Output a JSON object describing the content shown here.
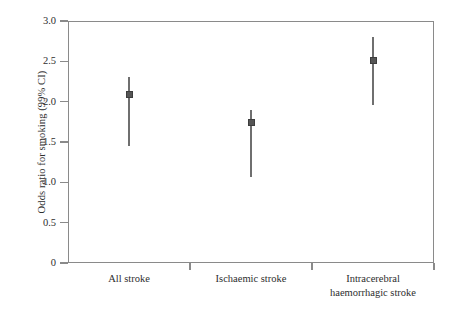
{
  "chart_data": {
    "type": "scatter",
    "title": "",
    "subtitle": "",
    "xlabel": "",
    "ylabel": "Odds ratio for smoking (99% CI)",
    "categories": [
      "All stroke",
      "Ischaemic stroke",
      "Intracerebral haemorrhagic stroke"
    ],
    "category_lines": [
      [
        "All stroke"
      ],
      [
        "Ischaemic stroke"
      ],
      [
        "Intracerebral",
        "haemorrhagic stroke"
      ]
    ],
    "values": [
      2.09,
      1.74,
      2.51
    ],
    "ci_low": [
      1.45,
      1.07,
      1.96
    ],
    "ci_high": [
      2.31,
      1.9,
      2.8
    ],
    "series": [
      {
        "name": "Odds ratio for smoking",
        "points": [
          {
            "category": "All stroke",
            "value": 2.09,
            "ci_low": 1.45,
            "ci_high": 2.31
          },
          {
            "category": "Ischaemic stroke",
            "value": 1.74,
            "ci_low": 1.07,
            "ci_high": 1.9
          },
          {
            "category": "Intracerebral haemorrhagic stroke",
            "value": 2.51,
            "ci_low": 1.96,
            "ci_high": 2.8
          }
        ]
      }
    ],
    "ylim": [
      0,
      3.0
    ],
    "yticks": [
      0,
      0.5,
      1.0,
      1.5,
      2.0,
      2.5,
      3.0
    ],
    "ytick_labels": [
      "0",
      "0.5",
      "1.0",
      "1.5",
      "2.0",
      "2.5",
      "3.0"
    ],
    "grid": false,
    "legend": false,
    "legend_position": "none",
    "marker": "square",
    "colors": {
      "marker": "#555555",
      "ci_line": "#6f6f6f",
      "axis": "#8a8a8a",
      "text": "#2e2e2e",
      "background": "#ffffff"
    }
  }
}
